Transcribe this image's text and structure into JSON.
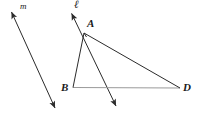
{
  "figure": {
    "width": 198,
    "height": 118,
    "background_color": "#ffffff"
  },
  "colors": {
    "stroke_dark": "#2b2b2b",
    "stroke_light": "#8c8c8c",
    "label_color": "#1a1a1a"
  },
  "labels": {
    "line_m": "m",
    "line_l": "ℓ",
    "vertex_a": "A",
    "vertex_b": "B",
    "vertex_d": "D"
  },
  "points": {
    "A": {
      "x": 84,
      "y": 33
    },
    "B": {
      "x": 73,
      "y": 87
    },
    "D": {
      "x": 180,
      "y": 88
    }
  },
  "lines": [
    {
      "name": "line-m",
      "label": "m",
      "kind": "double-arrow",
      "from": {
        "x": 10,
        "y": 9
      },
      "to": {
        "x": 57,
        "y": 112
      },
      "color": "#2b2b2b",
      "width": 1
    },
    {
      "name": "line-l",
      "label": "ℓ",
      "kind": "double-arrow",
      "from": {
        "x": 70,
        "y": 10
      },
      "to": {
        "x": 118,
        "y": 110
      },
      "color": "#2b2b2b",
      "width": 1
    }
  ],
  "segments": [
    {
      "name": "segment-ab",
      "from": "A",
      "to": "B",
      "color": "#2b2b2b",
      "width": 1
    },
    {
      "name": "segment-ad",
      "from": "A",
      "to": "D",
      "color": "#2b2b2b",
      "width": 1
    },
    {
      "name": "segment-bd",
      "from": "B",
      "to": "D",
      "color": "#9a9a9a",
      "width": 1
    }
  ],
  "label_positions": {
    "line_m": {
      "x": 20,
      "y": 3
    },
    "line_l": {
      "x": 74,
      "y": 0
    },
    "vertex_a": {
      "x": 87,
      "y": 18
    },
    "vertex_b": {
      "x": 61,
      "y": 81
    },
    "vertex_d": {
      "x": 183,
      "y": 81
    }
  }
}
